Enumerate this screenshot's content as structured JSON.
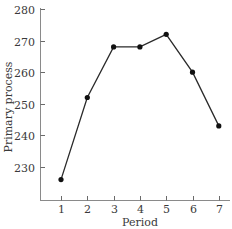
{
  "chart_data": {
    "type": "line",
    "title": "",
    "xlabel": "Period",
    "ylabel": "Primary process",
    "x": [
      1,
      2,
      3,
      4,
      5,
      6,
      7
    ],
    "categories": [
      "1",
      "2",
      "3",
      "4",
      "5",
      "6",
      "7"
    ],
    "series": [
      {
        "name": "Primary process",
        "values": [
          226,
          252,
          268,
          268,
          272,
          260,
          243
        ]
      }
    ],
    "ylim": [
      219,
      280
    ],
    "yticks": [
      230,
      240,
      250,
      260,
      270,
      280
    ],
    "ytick_labels": [
      "230",
      "240",
      "250",
      "260",
      "270",
      "280"
    ],
    "xticks": [
      1,
      2,
      3,
      4,
      5,
      6,
      7
    ],
    "grid": false,
    "legend": false,
    "markers": "filled-circle",
    "colors": {
      "line": "#2a2a2a",
      "marker": "#111111",
      "axis": "#8a8a8a"
    }
  }
}
